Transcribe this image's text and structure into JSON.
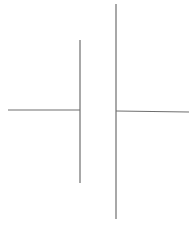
{
  "diagram": {
    "type": "battery-cell-symbol",
    "stroke_color": "#6e6e6e",
    "background": "#ffffff",
    "left_lead": {
      "x1": 8,
      "y1": 110,
      "x2": 80,
      "y2": 110
    },
    "negative_plate": {
      "x": 80,
      "y1": 40,
      "y2": 183
    },
    "positive_plate": {
      "x": 116,
      "y1": 4,
      "y2": 219
    },
    "right_lead": {
      "x1": 116,
      "y1": 111,
      "x2": 189,
      "y2": 112
    }
  }
}
